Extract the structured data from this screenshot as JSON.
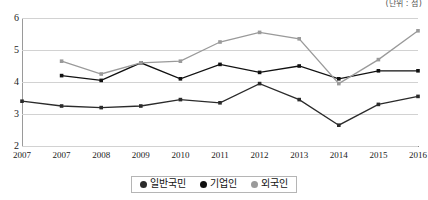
{
  "unit_note": "(단위 : 점)",
  "legend": {
    "position": "bottom-center",
    "items": [
      {
        "label": "일반국민",
        "color": "#2b2b2b",
        "marker": "filled-circle"
      },
      {
        "label": "기업인",
        "color": "#111111",
        "marker": "filled-circle"
      },
      {
        "label": "외국인",
        "color": "#9a9a9a",
        "marker": "filled-circle"
      }
    ]
  },
  "chart_data": {
    "type": "line",
    "title": "",
    "subtitle": "",
    "xlabel": "",
    "ylabel": "",
    "ylim": [
      2,
      6
    ],
    "yticks": [
      2,
      3,
      4,
      5,
      6
    ],
    "grid": true,
    "categories": [
      "2007",
      "2007",
      "2008",
      "2009",
      "2010",
      "2011",
      "2012",
      "2013",
      "2014",
      "2015",
      "2016"
    ],
    "series": [
      {
        "name": "일반국민",
        "color": "#2b2b2b",
        "values": [
          3.4,
          3.25,
          3.2,
          3.25,
          3.45,
          3.35,
          3.95,
          3.45,
          2.65,
          3.3,
          3.55
        ]
      },
      {
        "name": "기업인",
        "color": "#111111",
        "values": [
          null,
          4.2,
          4.05,
          4.6,
          4.1,
          4.55,
          4.3,
          4.5,
          4.1,
          4.35,
          4.35
        ]
      },
      {
        "name": "외국인",
        "color": "#9a9a9a",
        "values": [
          null,
          4.65,
          4.25,
          4.6,
          4.65,
          5.25,
          5.55,
          5.35,
          3.95,
          4.7,
          5.6
        ]
      }
    ]
  }
}
